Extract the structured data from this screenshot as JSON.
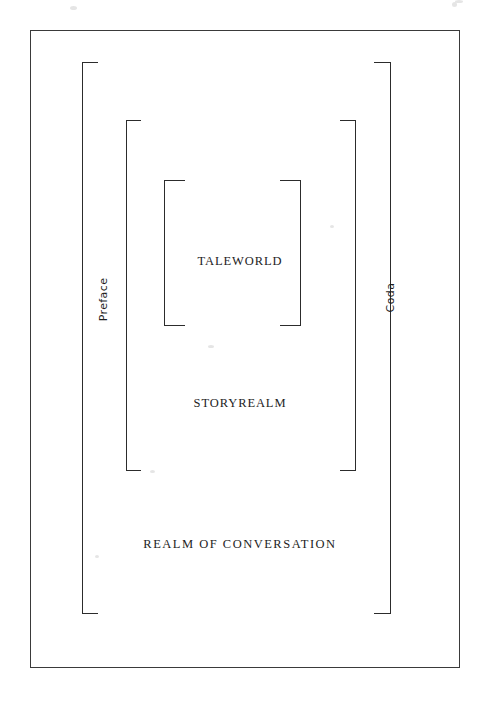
{
  "figure": {
    "type": "nested-frame-diagram",
    "background_color": "#ffffff",
    "ink_color": "#2c2c2c",
    "frame_border_color": "#3a3a3a"
  },
  "page_frame": {
    "name": "outer-page-border",
    "x": 30,
    "y": 30,
    "width": 430,
    "height": 638
  },
  "levels": [
    {
      "id": "realm-of-conversation",
      "label": "REALM OF CONVERSATION",
      "label_x": 240,
      "label_y": 545,
      "bracket": {
        "left_x": 82,
        "right_x": 390,
        "top_y": 62,
        "bottom_y": 613,
        "serif_len": 16
      }
    },
    {
      "id": "storyrealm",
      "label": "STORYREALM",
      "label_x": 240,
      "label_y": 404,
      "bracket": {
        "left_x": 126,
        "right_x": 355,
        "top_y": 120,
        "bottom_y": 470,
        "serif_len": 15
      }
    },
    {
      "id": "taleworld",
      "label": "TALEWORLD",
      "label_x": 240,
      "label_y": 262,
      "bracket": {
        "left_x": 164,
        "right_x": 300,
        "top_y": 180,
        "bottom_y": 325,
        "serif_len": 21
      }
    }
  ],
  "side_labels": [
    {
      "id": "preface",
      "label": "Preface",
      "side": "left",
      "x": 103,
      "y": 300
    },
    {
      "id": "coda",
      "label": "Coda",
      "side": "right",
      "x": 390,
      "y": 298
    }
  ]
}
